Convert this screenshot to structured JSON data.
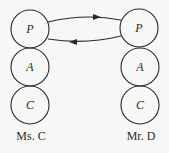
{
  "diagram": {
    "type": "transactional-analysis",
    "left_person": {
      "name": "Ms. C",
      "ego_states": [
        {
          "label": "P"
        },
        {
          "label": "A"
        },
        {
          "label": "C"
        }
      ]
    },
    "right_person": {
      "name": "Mr. D",
      "ego_states": [
        {
          "label": "P"
        },
        {
          "label": "A"
        },
        {
          "label": "C"
        }
      ]
    },
    "transactions": [
      {
        "from": "Ms. C P",
        "to": "Mr. D P",
        "direction": "right"
      },
      {
        "from": "Mr. D P",
        "to": "Ms. C P",
        "direction": "left"
      }
    ]
  }
}
